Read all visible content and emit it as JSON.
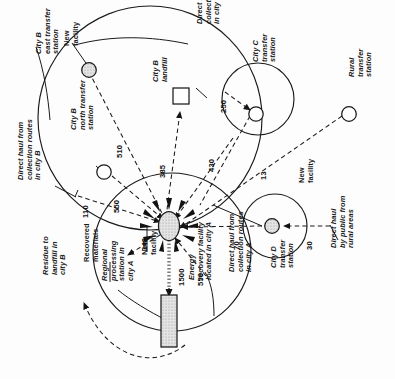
{
  "figure": {
    "orientation": "rotated-90-ccw",
    "type": "solid-waste-management-network-diagram",
    "background": "#fdfdfd",
    "ink": "#1a1a1a",
    "shade": "#cfcfcf"
  },
  "nodes": [
    {
      "id": "city-b-east-transfer-station",
      "label": "City B\neast transfer\nstation",
      "kind": "shaded-circle",
      "new_facility": true
    },
    {
      "id": "city-b-north-transfer-station",
      "label": "City B\nnorth transfer\nstation",
      "kind": "open-circle",
      "new_facility": false
    },
    {
      "id": "city-b-landfill",
      "label": "City B\nlandfill",
      "kind": "square",
      "new_facility": false
    },
    {
      "id": "city-c-transfer-station",
      "label": "City C\ntransfer\nstation",
      "kind": "open-circle",
      "new_facility": false
    },
    {
      "id": "city-d-transfer-station",
      "label": "City D\ntransfer\nstation",
      "kind": "shaded-circle",
      "new_facility": true
    },
    {
      "id": "rural-transfer-station",
      "label": "Rural\ntransfer\nstation",
      "kind": "open-circle",
      "new_facility": false
    },
    {
      "id": "regional-processing-station",
      "label": "Regional\nprocessing\nstation in\ncity A",
      "kind": "shaded-ellipse-starburst",
      "new_facility": true
    },
    {
      "id": "energy-recovery-facility",
      "label": "Energy\nrecovery facility\nlocated in city A",
      "kind": "shaded-rectangle",
      "new_facility": false
    }
  ],
  "callouts": {
    "new_facility_east": "New\nfacility",
    "new_facility_hub": "New\nfacility",
    "new_facility_city_d": "New\nfacility",
    "recovered_materials": "Recovered\nmaterials",
    "residue_to_landfill": "Residue to\nlandfill in\ncity B",
    "direct_haul_city_b": "Direct haul from\ncollection routes\nin city B",
    "direct_haul_city_b_2": "Direct haul from\ncollection routes\nin city B",
    "direct_haul_city_a": "Direct haul from\ncollection routes\nin city A",
    "direct_haul_public_rural": "Direct haul\nby public from\nrural areas"
  },
  "flows": [
    {
      "id": "flow-east-to-hub",
      "value": "510",
      "from": "city-b-east-transfer-station",
      "to": "regional-processing-station",
      "style": "dashed"
    },
    {
      "id": "flow-hub-to-landfill",
      "value": "385",
      "from": "regional-processing-station",
      "to": "city-b-landfill",
      "style": "dashed"
    },
    {
      "id": "flow-north-to-hub",
      "value": "550",
      "from": "city-b-north-transfer-station",
      "to": "regional-processing-station",
      "style": "dashed"
    },
    {
      "id": "flow-direct-b-hub",
      "value": "110",
      "from": "direct-haul-city-b",
      "to": "regional-processing-station",
      "style": "dashed"
    },
    {
      "id": "flow-hub-to-city-c",
      "value": "250",
      "from": "regional-processing-station",
      "to": "city-c-transfer-station",
      "style": "dashed"
    },
    {
      "id": "flow-direct-b2-hub",
      "value": "430",
      "from": "direct-haul-city-b-2",
      "to": "regional-processing-station",
      "style": "dashed"
    },
    {
      "id": "flow-rural-to-hub",
      "value": "13",
      "from": "rural-transfer-station",
      "to": "regional-processing-station",
      "style": "dashed"
    },
    {
      "id": "flow-city-d-to-hub",
      "value": "70",
      "from": "city-d-transfer-station",
      "to": "regional-processing-station",
      "style": "dashed"
    },
    {
      "id": "flow-public-to-d",
      "value": "30",
      "from": "direct-haul-public-rural",
      "to": "city-d-transfer-station",
      "style": "dashed"
    },
    {
      "id": "flow-recovered",
      "value": "348",
      "from": "regional-processing-station",
      "to": "recovered-materials",
      "style": "dashed"
    },
    {
      "id": "flow-to-energy",
      "value": "1500",
      "from": "regional-processing-station",
      "to": "energy-recovery-facility",
      "style": "dotted"
    },
    {
      "id": "flow-direct-a-hub",
      "value": "550",
      "from": "direct-haul-city-a",
      "to": "regional-processing-station",
      "style": "dashed"
    }
  ]
}
